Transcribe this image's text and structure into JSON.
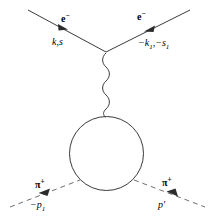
{
  "diagram": {
    "background_color": "#ffffff",
    "line_color": "#3a3a3a",
    "text_color": "#000000",
    "labels": {
      "incoming_electron_particle": "e",
      "incoming_electron_charge": "−",
      "incoming_electron_momentum": "k,s",
      "outgoing_electron_particle": "e",
      "outgoing_electron_charge": "−",
      "outgoing_electron_momentum_base": "−k",
      "outgoing_electron_momentum_sub1": "1",
      "outgoing_electron_momentum_mid": ",−s",
      "outgoing_electron_momentum_sub2": "1",
      "incoming_pion_particle": "π",
      "incoming_pion_charge": "+",
      "incoming_pion_momentum_base": "−p",
      "incoming_pion_momentum_sub": "1",
      "outgoing_pion_particle": "π",
      "outgoing_pion_charge": "+",
      "outgoing_pion_momentum": "p′"
    },
    "geometry": {
      "electron_vertex_x": 106,
      "electron_vertex_y": 52,
      "photon_top_y": 54,
      "photon_bottom_y": 117,
      "loop_center_x": 106.5,
      "loop_center_y": 153.5,
      "loop_radius": 37
    }
  }
}
